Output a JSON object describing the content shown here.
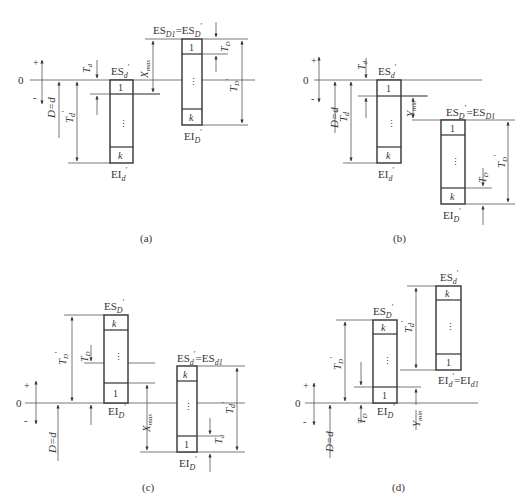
{
  "figure": {
    "panels": [
      {
        "id": "a",
        "caption": "(a)",
        "axis": {
          "zero": "0",
          "plus": "+",
          "minus": "-"
        },
        "labels": {
          "basic_size": "D=d",
          "shaft_upper": "ES",
          "shaft_upper_sub": "d",
          "shaft_lower": "EI",
          "shaft_lower_sub": "d",
          "hole_upper": "ES",
          "hole_upper_sub": "D1",
          "hole_upper_eq": "=ES",
          "hole_upper_eq_sub": "D",
          "hole_lower": "EI",
          "hole_lower_sub": "D",
          "Td": "T",
          "Td_sub": "d",
          "Td_prime": "T",
          "Td_prime_sub": "d",
          "TD": "T",
          "TD_sub": "D",
          "TD_prime": "T",
          "TD_prime_sub": "D",
          "clearance": "X",
          "clearance_sub": "max"
        },
        "cells": {
          "first": "1",
          "dots": "⋮",
          "last": "k"
        }
      },
      {
        "id": "b",
        "caption": "(b)",
        "axis": {
          "zero": "0",
          "plus": "+",
          "minus": "-"
        },
        "labels": {
          "basic_size": "D=d",
          "shaft_upper": "ES",
          "shaft_upper_sub": "d",
          "shaft_lower": "EI",
          "shaft_lower_sub": "d",
          "hole_upper": "ES",
          "hole_upper_sub": "D",
          "hole_upper_eq": "=ES",
          "hole_upper_eq_sub": "D1",
          "hole_lower": "EI",
          "hole_lower_sub": "D",
          "Td": "T",
          "Td_sub": "d",
          "Td_prime": "T",
          "Td_prime_sub": "d",
          "TD": "T",
          "TD_sub": "D",
          "TD_prime": "T",
          "TD_prime_sub": "D",
          "interference": "Y",
          "interference_sub": "min"
        },
        "cells": {
          "first": "1",
          "dots": "⋮",
          "last": "k"
        }
      },
      {
        "id": "c",
        "caption": "(c)",
        "axis": {
          "zero": "0",
          "plus": "+",
          "minus": "-"
        },
        "labels": {
          "basic_size": "D=d",
          "hole_upper": "ES",
          "hole_upper_sub": "D",
          "hole_lower": "EI",
          "hole_lower_sub": "D",
          "shaft_upper": "ES",
          "shaft_upper_sub": "d",
          "shaft_upper_eq": "=ES",
          "shaft_upper_eq_sub": "d1",
          "shaft_lower": "EI",
          "shaft_lower_sub": "D",
          "TD_prime": "T",
          "TD_prime_sub": "D",
          "TD": "T",
          "TD_sub": "D",
          "Td_prime": "T",
          "Td_prime_sub": "d",
          "Td": "T",
          "Td_sub": "d",
          "clearance": "X",
          "clearance_sub": "max"
        },
        "cells": {
          "first": "1",
          "dots": "⋮",
          "last": "k"
        }
      },
      {
        "id": "d",
        "caption": "(d)",
        "axis": {
          "zero": "0",
          "plus": "+",
          "minus": "-"
        },
        "labels": {
          "basic_size": "D=d",
          "hole_upper": "ES",
          "hole_upper_sub": "D",
          "hole_lower": "EI",
          "hole_lower_sub": "D",
          "shaft_upper": "ES",
          "shaft_upper_sub": "d",
          "shaft_lower": "EI",
          "shaft_lower_sub": "d",
          "shaft_lower_eq": "=EI",
          "shaft_lower_eq_sub": "d1",
          "TD_prime": "T",
          "TD_prime_sub": "D",
          "TD": "T",
          "TD_sub": "D",
          "Td_prime": "T",
          "Td_prime_sub": "d",
          "interference": "Y",
          "interference_sub": "min"
        },
        "cells": {
          "first": "1",
          "dots": "⋮",
          "last": "k"
        }
      }
    ]
  }
}
